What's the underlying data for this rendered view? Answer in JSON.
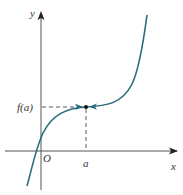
{
  "figure": {
    "axes": {
      "x_label": "x",
      "y_label": "y",
      "origin_label": "O"
    },
    "point": {
      "x_label": "a",
      "y_label": "f(a)"
    },
    "colors": {
      "curve": "#2a6b7c",
      "axis": "#555555",
      "point": "#111111",
      "guide": "#333333"
    }
  }
}
